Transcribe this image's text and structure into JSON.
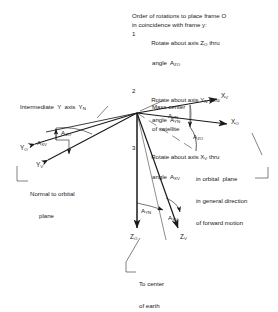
{
  "figure": {
    "caption_block": {
      "header_line1": "Order of rotations to place frame O",
      "header_line2": "in coincidence with frame y:",
      "steps": [
        {
          "num": "1",
          "line1_pre": "Rotate about axis Z",
          "line1_sub": "O",
          "line1_post": " thru",
          "line2_pre": "angle  A",
          "line2_sub": "ZO"
        },
        {
          "num": "2",
          "line1_pre": "Rotate about axis Y",
          "line1_sub": "N",
          "line1_post": " thru",
          "line2_pre": "angle  A",
          "line2_sub": "YN"
        },
        {
          "num": "3",
          "line1_pre": "Rotate about axis X",
          "line1_sub": "V",
          "line1_post": " thru",
          "line2_pre": "angle  A",
          "line2_sub": "XV"
        }
      ]
    },
    "callouts": {
      "mass_center_l1": "Mass center",
      "mass_center_l2": "of satellite",
      "intermediate_axis": "Intermediate  Y  axis  Y",
      "intermediate_axis_sub": "N",
      "normal_l1": "Normal to orbital",
      "normal_l2": "plane",
      "orbital_l1": "in orbital  plane",
      "orbital_l2": "in general direction",
      "orbital_l3": "of forward motion",
      "earth_l1": "To center",
      "earth_l2": "of earth"
    },
    "axes": [
      {
        "name": "X_V",
        "base": "X",
        "sub": "V"
      },
      {
        "name": "X_O",
        "base": "X",
        "sub": "O"
      },
      {
        "name": "Y_O",
        "base": "Y",
        "sub": "O"
      },
      {
        "name": "Y_V",
        "base": "Y",
        "sub": "V"
      },
      {
        "name": "Z_O",
        "base": "Z",
        "sub": "O"
      },
      {
        "name": "Z_V",
        "base": "Z",
        "sub": "V"
      }
    ],
    "angle_labels": [
      {
        "name": "A_ZO_left",
        "base": "A",
        "sub": "ZO"
      },
      {
        "name": "A_XV_left",
        "base": "A",
        "sub": "XV"
      },
      {
        "name": "A_YN_upper",
        "base": "A",
        "sub": "YN"
      },
      {
        "name": "A_ZO_right",
        "base": "A",
        "sub": "ZO"
      },
      {
        "name": "A_YN_lower",
        "base": "A",
        "sub": "YN"
      },
      {
        "name": "A_XV_lower",
        "base": "A",
        "sub": "XV"
      }
    ],
    "colors": {
      "ink": "#1a1a1a",
      "paper": "#ffffff"
    }
  }
}
